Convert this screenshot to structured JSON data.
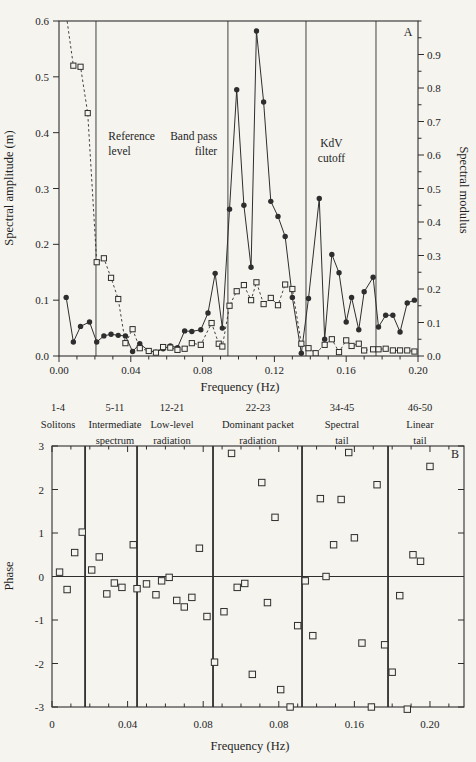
{
  "figure": {
    "panel_a_letter": "A",
    "panel_b_letter": "B"
  },
  "chart_data": [
    {
      "type": "line",
      "panel": "A",
      "xlabel": "Frequency (Hz)",
      "ylabel_left": "Spectral amplitude (m)",
      "ylabel_right": "Spectral modulus",
      "xlim": [
        0,
        0.2
      ],
      "ylim_left": [
        0,
        0.6
      ],
      "ylim_right": [
        0,
        1.0
      ],
      "grid": false,
      "x_ticks": {
        "values": [
          0,
          0.04,
          0.08,
          0.12,
          0.16,
          0.2
        ],
        "labels": [
          "0.00",
          "0.04",
          "0.08",
          "0.12",
          "0.16",
          "0.20"
        ],
        "minor_step": 0.01
      },
      "y_ticks_left": {
        "values": [
          0,
          0.1,
          0.2,
          0.3,
          0.4,
          0.5,
          0.6
        ],
        "labels": [
          "0.0",
          "0.1",
          "0.2",
          "0.3",
          "0.4",
          "0.5",
          "0.6"
        ]
      },
      "y_ticks_right": {
        "values": [
          0,
          0.1,
          0.2,
          0.3,
          0.4,
          0.5,
          0.6,
          0.7,
          0.8,
          0.9
        ],
        "labels": [
          "0.0",
          "0.1",
          "0.2",
          "0.3",
          "0.4",
          "0.5",
          "0.6",
          "0.7",
          "0.8",
          "0.9"
        ],
        "minor_step": 0.05
      },
      "vlines": [
        0.0206,
        0.0941,
        0.1376,
        0.1766
      ],
      "annotations": [
        {
          "lines": [
            "Reference",
            "level"
          ],
          "f": 0.0275,
          "amp": 0.387,
          "anchor": "start"
        },
        {
          "lines": [
            "Band pass",
            "filter"
          ],
          "f": 0.0881,
          "amp": 0.387,
          "anchor": "end"
        },
        {
          "lines": [
            "KdV",
            "cutoff"
          ],
          "f": 0.1518,
          "amp": 0.374,
          "anchor": "middle"
        }
      ],
      "corner_label": {
        "text": "A",
        "f": 0.1945,
        "amp": 0.573
      },
      "series": [
        {
          "name": "spectral-amplitude-filled-circles",
          "marker": "filled-circle",
          "line": "solid",
          "x": [
            0.004,
            0.008,
            0.012,
            0.017,
            0.021,
            0.025,
            0.029,
            0.033,
            0.037,
            0.041,
            0.045,
            0.05,
            0.054,
            0.058,
            0.062,
            0.066,
            0.07,
            0.074,
            0.079,
            0.083,
            0.087,
            0.091,
            0.095,
            0.099,
            0.103,
            0.107,
            0.11,
            0.114,
            0.118,
            0.122,
            0.126,
            0.13,
            0.135,
            0.139,
            0.145,
            0.148,
            0.152,
            0.156,
            0.16,
            0.163,
            0.167,
            0.17,
            0.175,
            0.178,
            0.182,
            0.186,
            0.19,
            0.194,
            0.198
          ],
          "y": [
            0.105,
            0.025,
            0.053,
            0.061,
            0.025,
            0.036,
            0.039,
            0.037,
            0.036,
            0.008,
            0.022,
            0.009,
            0.007,
            0.013,
            0.018,
            0.015,
            0.045,
            0.044,
            0.047,
            0.077,
            0.148,
            0.05,
            0.263,
            0.477,
            0.27,
            0.159,
            0.582,
            0.455,
            0.277,
            0.25,
            0.214,
            0.105,
            0.005,
            0.103,
            0.282,
            0.03,
            0.182,
            0.149,
            0.061,
            0.105,
            0.047,
            0.115,
            0.141,
            0.052,
            0.073,
            0.073,
            0.043,
            0.095,
            0.1
          ]
        },
        {
          "name": "spectral-modulus-open-squares",
          "marker": "open-square",
          "line": "dashed",
          "x": [
            0.003,
            0.008,
            0.012,
            0.016,
            0.021,
            0.025,
            0.029,
            0.033,
            0.037,
            0.041,
            0.045,
            0.05,
            0.054,
            0.058,
            0.062,
            0.066,
            0.07,
            0.074,
            0.079,
            0.085,
            0.089,
            0.091,
            0.095,
            0.099,
            0.103,
            0.107,
            0.11,
            0.114,
            0.118,
            0.122,
            0.126,
            0.13,
            0.135,
            0.139,
            0.143,
            0.148,
            0.152,
            0.156,
            0.16,
            0.163,
            0.167,
            0.17,
            0.175,
            0.178,
            0.182,
            0.186,
            0.19,
            0.194,
            0.198
          ],
          "y": [
            0.635,
            0.52,
            0.518,
            0.435,
            0.168,
            0.175,
            0.14,
            0.102,
            0.023,
            0.048,
            0.014,
            0.009,
            0.006,
            0.016,
            0.015,
            0.011,
            0.013,
            0.023,
            0.02,
            0.059,
            0.022,
            0.017,
            0.09,
            0.116,
            0.127,
            0.1,
            0.132,
            0.093,
            0.104,
            0.091,
            0.128,
            0.12,
            0.022,
            0.014,
            0.005,
            0.02,
            0.03,
            0.007,
            0.028,
            0.018,
            0.022,
            0.01,
            0.012,
            0.012,
            0.013,
            0.01,
            0.01,
            0.01,
            0.008
          ]
        }
      ]
    },
    {
      "type": "scatter",
      "panel": "B",
      "xlabel": "Frequency (Hz)",
      "ylabel": "Phase",
      "xlim": [
        0,
        0.218
      ],
      "ylim": [
        -3,
        3
      ],
      "grid": false,
      "zero_line": true,
      "x_ticks": {
        "values": [
          0,
          0.04,
          0.08,
          0.12,
          0.16,
          0.2
        ],
        "labels": [
          "0",
          "0.04",
          "0.08",
          "0.08",
          "0.16",
          "0.20"
        ],
        "minor_step": 0.01
      },
      "y_ticks": {
        "values": [
          3,
          2,
          1,
          0,
          -1,
          -2,
          -3
        ],
        "labels": [
          "3",
          "2",
          "1",
          "0",
          "-1",
          "-2",
          "-3"
        ]
      },
      "region_dividers": [
        0.0175,
        0.045,
        0.0852,
        0.1323,
        0.1778
      ],
      "group_labels": [
        {
          "range": "1-4",
          "lines": [
            "Solitons"
          ],
          "f": 0.0032
        },
        {
          "range": "5-11",
          "lines": [
            "Intermediate",
            "spectrum"
          ],
          "f": 0.0333
        },
        {
          "range": "12-21",
          "lines": [
            "Low-level",
            "radiation"
          ],
          "f": 0.0635
        },
        {
          "range": "22-23",
          "lines": [
            "Dominant packet",
            "radiation"
          ],
          "f": 0.109
        },
        {
          "range": "34-45",
          "lines": [
            "Spectral",
            "tail"
          ],
          "f": 0.1534
        },
        {
          "range": "46-50",
          "lines": [
            "Linear",
            "tail"
          ],
          "f": 0.1947
        }
      ],
      "corner_label": {
        "text": "B"
      },
      "series": [
        {
          "name": "phase-open-squares",
          "marker": "open-square",
          "x": [
            0.004,
            0.008,
            0.012,
            0.016,
            0.021,
            0.025,
            0.029,
            0.033,
            0.037,
            0.043,
            0.045,
            0.05,
            0.055,
            0.058,
            0.062,
            0.066,
            0.07,
            0.074,
            0.078,
            0.082,
            0.086,
            0.091,
            0.095,
            0.098,
            0.102,
            0.106,
            0.111,
            0.114,
            0.118,
            0.121,
            0.126,
            0.13,
            0.134,
            0.138,
            0.142,
            0.145,
            0.149,
            0.153,
            0.157,
            0.16,
            0.164,
            0.169,
            0.172,
            0.176,
            0.18,
            0.184,
            0.188,
            0.191,
            0.195,
            0.2
          ],
          "y": [
            0.1,
            -0.3,
            0.55,
            1.02,
            0.15,
            0.45,
            -0.4,
            -0.15,
            -0.25,
            0.73,
            -0.28,
            -0.17,
            -0.42,
            -0.1,
            -0.02,
            -0.55,
            -0.7,
            -0.48,
            0.65,
            -0.92,
            -1.97,
            -0.81,
            2.83,
            -0.25,
            -0.16,
            -2.25,
            2.16,
            -0.6,
            1.36,
            -2.6,
            -3.0,
            -1.13,
            -0.1,
            -1.36,
            1.79,
            0.0,
            0.73,
            1.77,
            2.85,
            0.89,
            -1.53,
            -3.0,
            2.11,
            -1.57,
            -2.2,
            -0.44,
            -3.05,
            0.5,
            0.35,
            2.53
          ]
        }
      ]
    }
  ],
  "colors": {
    "ink": "#2e2e2e",
    "text": "#1e1e1e",
    "paper": "#f5f4ef"
  }
}
